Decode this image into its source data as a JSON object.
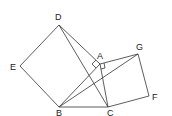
{
  "diagram": {
    "type": "geometry",
    "points": {
      "A": {
        "label": "A",
        "x": 100,
        "y": 64
      },
      "B": {
        "label": "B",
        "x": 59,
        "y": 107
      },
      "C": {
        "label": "C",
        "x": 108,
        "y": 107
      },
      "D": {
        "label": "D",
        "x": 59,
        "y": 25
      },
      "E": {
        "label": "E",
        "x": 20,
        "y": 66
      },
      "F": {
        "label": "F",
        "x": 149,
        "y": 96
      },
      "G": {
        "label": "G",
        "x": 138,
        "y": 54
      }
    },
    "segments": [
      [
        "D",
        "E"
      ],
      [
        "E",
        "B"
      ],
      [
        "B",
        "A"
      ],
      [
        "A",
        "D"
      ],
      [
        "A",
        "G"
      ],
      [
        "G",
        "F"
      ],
      [
        "F",
        "C"
      ],
      [
        "C",
        "A"
      ],
      [
        "B",
        "C"
      ],
      [
        "D",
        "C"
      ],
      [
        "B",
        "G"
      ]
    ],
    "right_angle_markers": [
      "A (square ABDE)",
      "A (square ACFG)"
    ]
  }
}
